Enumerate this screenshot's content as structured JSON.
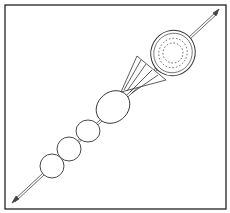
{
  "illustration": {
    "subject": "fruit skewer line drawing",
    "items": [
      {
        "name": "kiwi slice"
      },
      {
        "name": "pineapple wedge"
      },
      {
        "name": "large round fruit"
      },
      {
        "name": "round fruit"
      },
      {
        "name": "round fruit"
      },
      {
        "name": "round fruit"
      }
    ],
    "colors": {
      "line": "#333333",
      "background": "#ffffff"
    }
  }
}
